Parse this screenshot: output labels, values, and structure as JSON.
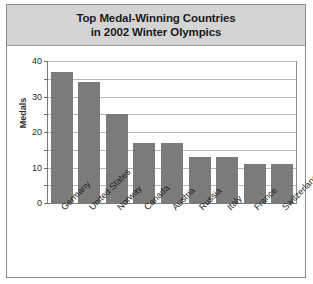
{
  "chart_data": {
    "type": "bar",
    "title": "Top Medal-Winning Countries in 2002 Winter Olympics",
    "title_lines": [
      "Top Medal-Winning Countries",
      "in 2002 Winter Olympics"
    ],
    "categories": [
      "Germany",
      "United States",
      "Norway",
      "Canada",
      "Austria",
      "Russia",
      "Italy",
      "France",
      "Switzerland"
    ],
    "values": [
      37,
      34,
      25,
      17,
      17,
      13,
      13,
      11,
      11
    ],
    "xlabel": "",
    "ylabel": "Medals",
    "ylim": [
      0,
      40
    ],
    "ytick_values": [
      0,
      10,
      20,
      30,
      40
    ],
    "ytick_labels": [
      "0",
      "10",
      "20",
      "30",
      "40"
    ],
    "gridline_values": [
      5,
      10,
      15,
      20,
      25,
      30,
      35,
      40
    ],
    "minor_tick_values": [
      5,
      15,
      25,
      35
    ],
    "grid": true,
    "legend": false,
    "bar_color": "#7b7b7b",
    "title_band_color": "#d4d4d4",
    "grid_color": "#b9b9b9",
    "axis_color": "#7a7a7a"
  }
}
